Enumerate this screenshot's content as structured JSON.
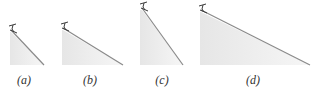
{
  "colors": {
    "fill": "#ececec",
    "slope": "#8a8a8a",
    "skier": "#3a3a3a",
    "label": "#333333"
  },
  "panels": [
    {
      "id": "a",
      "label": "(a)",
      "apex": [
        11,
        30
      ],
      "base_left": 10,
      "base_right": 44,
      "base_y": 65,
      "label_x": 24,
      "label_y": 73
    },
    {
      "id": "b",
      "label": "(b)",
      "apex": [
        63,
        28
      ],
      "base_left": 62,
      "base_right": 123,
      "base_y": 65,
      "label_x": 90,
      "label_y": 73
    },
    {
      "id": "c",
      "label": "(c)",
      "apex": [
        142,
        8
      ],
      "base_left": 140,
      "base_right": 183,
      "base_y": 65,
      "label_x": 162,
      "label_y": 73
    },
    {
      "id": "d",
      "label": "(d)",
      "apex": [
        201,
        10
      ],
      "base_left": 200,
      "base_right": 310,
      "base_y": 65,
      "label_x": 253,
      "label_y": 73
    }
  ]
}
